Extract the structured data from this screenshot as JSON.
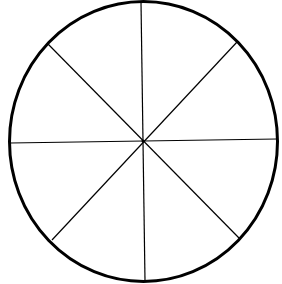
{
  "diagram": {
    "type": "circle-divided-into-segments",
    "segments": 8,
    "colors": {
      "background": "#ffffff",
      "stroke": "#000000"
    },
    "circle": {
      "cx": 143.5,
      "cy": 141.5,
      "rx": 134,
      "ry": 140,
      "stroke_width": 3
    },
    "spokes": [
      {
        "x1": 141,
        "y1": 2,
        "x2": 145,
        "y2": 281
      },
      {
        "x1": 10,
        "y1": 143,
        "x2": 277,
        "y2": 139
      },
      {
        "x1": 48,
        "y1": 44,
        "x2": 239,
        "y2": 238
      },
      {
        "x1": 237,
        "y1": 42,
        "x2": 52,
        "y2": 240
      }
    ]
  }
}
